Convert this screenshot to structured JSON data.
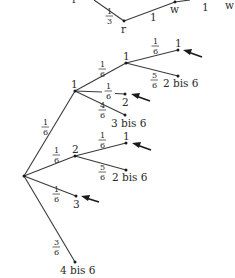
{
  "diagram": {
    "type": "probability-tree",
    "top_fragment": {
      "nodes": [
        {
          "id": "r_top_left",
          "label": "r",
          "x": 75,
          "y": -4
        },
        {
          "id": "r",
          "label": "r",
          "x": 124,
          "y": 21
        },
        {
          "id": "w",
          "label": "w",
          "x": 175,
          "y": 2
        },
        {
          "id": "w_right",
          "label": "w",
          "x": 229,
          "y": 2
        }
      ],
      "edges": [
        {
          "from": [
            94,
            0
          ],
          "to": [
            124,
            21
          ],
          "prob_num": "1",
          "prob_den": "3",
          "lx": 110,
          "ly": 13
        },
        {
          "from": [
            124,
            21
          ],
          "to": [
            175,
            2
          ],
          "prob_text": "1",
          "lx": 152,
          "ly": 20
        },
        {
          "from": [
            175,
            2
          ],
          "to": [
            188,
            0
          ],
          "prob_text": "1",
          "lx": 204,
          "ly": 9
        }
      ]
    },
    "root": {
      "x": 24,
      "y": 176
    },
    "level1": [
      {
        "id": "n1",
        "label": "1",
        "x": 75,
        "y": 91,
        "prob_num": "1",
        "prob_den": "6",
        "plx": 44,
        "ply": 130
      },
      {
        "id": "n2",
        "label": "2",
        "x": 75,
        "y": 156,
        "prob_num": "1",
        "prob_den": "6",
        "plx": 56,
        "ply": 162
      },
      {
        "id": "n3",
        "label": "3",
        "x": 76,
        "y": 196,
        "prob_num": "1",
        "prob_den": "6",
        "plx": 56,
        "ply": 200,
        "arrow": true
      },
      {
        "id": "n4",
        "label": "4 bis 6",
        "x": 75,
        "y": 262,
        "prob_num": "3",
        "prob_den": "6",
        "plx": 56,
        "ply": 240
      }
    ],
    "level2": [
      {
        "parent": "n1",
        "label": "1",
        "x": 126,
        "y": 63,
        "prob_num": "1",
        "prob_den": "6",
        "plx": 101,
        "ply": 72
      },
      {
        "parent": "n1",
        "label": "2",
        "x": 125,
        "y": 94,
        "prob_num": "1",
        "prob_den": "6",
        "plx": 108,
        "ply": 93,
        "arrow": true
      },
      {
        "parent": "n1",
        "label": "3 bis 6",
        "x": 125,
        "y": 115,
        "prob_num": "4",
        "prob_den": "6",
        "plx": 101,
        "ply": 114
      },
      {
        "parent": "n2",
        "label": "1",
        "x": 126,
        "y": 143,
        "prob_num": "1",
        "prob_den": "6",
        "plx": 102,
        "ply": 144,
        "arrow": true
      },
      {
        "parent": "n2",
        "label": "2 bis 6",
        "x": 126,
        "y": 170,
        "prob_num": "5",
        "prob_den": "6",
        "plx": 102,
        "ply": 171
      }
    ],
    "level3": [
      {
        "parent": "l2_1",
        "label": "1",
        "x": 178,
        "y": 50,
        "prob_num": "1",
        "prob_den": "6",
        "plx": 154,
        "ply": 47,
        "arrow": true
      },
      {
        "parent": "l2_1",
        "label": "2 bis 6",
        "x": 178,
        "y": 76,
        "prob_num": "5",
        "prob_den": "6",
        "plx": 155,
        "ply": 80
      }
    ],
    "labels": {
      "r_top_left": "r",
      "r": "r",
      "w": "w",
      "w_right": "w",
      "edge_top_1": "1",
      "edge_top_2": "1",
      "frac_1_3_num": "1",
      "frac_1_3_den": "3",
      "root_to_n1_num": "1",
      "root_to_n1_den": "6",
      "root_to_n2_num": "1",
      "root_to_n2_den": "6",
      "root_to_n3_num": "1",
      "root_to_n3_den": "6",
      "root_to_n4_num": "3",
      "root_to_n4_den": "6",
      "n1_label": "1",
      "n2_label": "2",
      "n3_label": "3",
      "n4_label": "4 bis 6",
      "n1_to_1_num": "1",
      "n1_to_1_den": "6",
      "n1_to_2_num": "1",
      "n1_to_2_den": "6",
      "n1_to_3b6_num": "4",
      "n1_to_3b6_den": "6",
      "n1_child1_label": "1",
      "n1_child2_label": "2",
      "n1_child3_label": "3 bis 6",
      "n11_to_1_num": "1",
      "n11_to_1_den": "6",
      "n11_to_2b6_num": "5",
      "n11_to_2b6_den": "6",
      "n11_child1_label": "1",
      "n11_child2_label": "2 bis 6",
      "n2_to_1_num": "1",
      "n2_to_1_den": "6",
      "n2_to_2b6_num": "5",
      "n2_to_2b6_den": "6",
      "n2_child1_label": "1",
      "n2_child2_label": "2 bis 6"
    }
  }
}
